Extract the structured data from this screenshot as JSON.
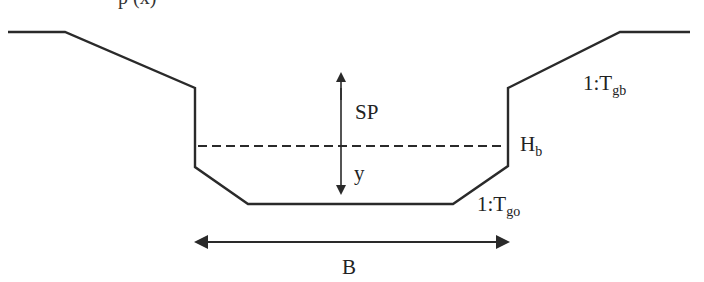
{
  "diagram": {
    "type": "channel cross-section",
    "cutoff_top_text": "p (x)",
    "labels": {
      "sp": "SP",
      "y": "y",
      "hb_main": "H",
      "hb_sub": "b",
      "tgb_main": "1:T",
      "tgb_sub": "gb",
      "tgo_main": "1:T",
      "tgo_sub": "go",
      "b": "B"
    },
    "colors": {
      "line": "#2a2a2a",
      "background": "#ffffff"
    }
  }
}
